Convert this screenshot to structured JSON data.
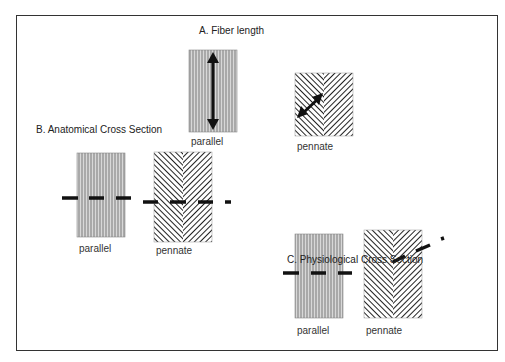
{
  "panels": {
    "a": {
      "title": "A. Fiber length",
      "parallel_label": "parallel",
      "pennate_label": "pennate"
    },
    "b": {
      "title": "B. Anatomical Cross Section",
      "parallel_label": "parallel",
      "pennate_label": "pennate"
    },
    "c": {
      "title": "C. Physiological Cross Section",
      "parallel_label": "parallel",
      "pennate_label": "pennate"
    }
  },
  "colors": {
    "line": "#111111",
    "fiber_light": "#9a9a9a",
    "frame": "#333333"
  }
}
